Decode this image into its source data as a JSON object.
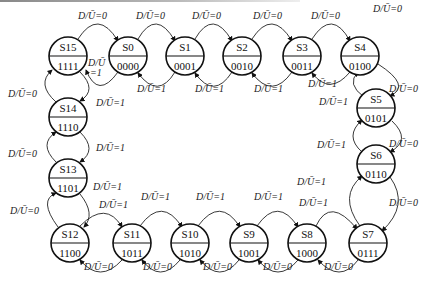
{
  "diagram": {
    "type": "state-diagram",
    "direction_label": "D/Ū",
    "up_condition": "D/Ū=1",
    "down_condition": "D/Ū=0",
    "states": [
      {
        "name": "S0",
        "code": "0000"
      },
      {
        "name": "S1",
        "code": "0001"
      },
      {
        "name": "S2",
        "code": "0010"
      },
      {
        "name": "S3",
        "code": "0011"
      },
      {
        "name": "S4",
        "code": "0100"
      },
      {
        "name": "S5",
        "code": "0101"
      },
      {
        "name": "S6",
        "code": "0110"
      },
      {
        "name": "S7",
        "code": "0111"
      },
      {
        "name": "S8",
        "code": "1000"
      },
      {
        "name": "S9",
        "code": "1001"
      },
      {
        "name": "S10",
        "code": "1010"
      },
      {
        "name": "S11",
        "code": "1011"
      },
      {
        "name": "S12",
        "code": "1100"
      },
      {
        "name": "S13",
        "code": "1101"
      },
      {
        "name": "S14",
        "code": "1110"
      },
      {
        "name": "S15",
        "code": "1111"
      }
    ],
    "transitions_down": "Sn -> S(n+1 mod 16) on D/Ū=0",
    "transitions_up": "Sn -> S(n-1 mod 16) on D/Ū=1"
  },
  "labels": {
    "d0": "D/Ū=0",
    "d1": "D/Ū=1",
    "d_split_top": "D/Ū",
    "d_split_bottom": "=1"
  }
}
